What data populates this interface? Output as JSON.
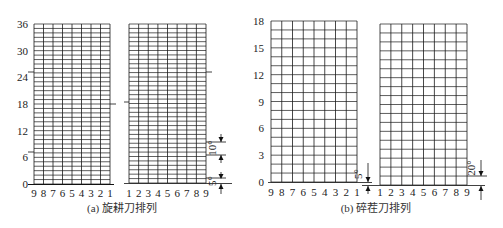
{
  "panels": [
    {
      "id": "a",
      "caption": "(a) 旋耕刀排列",
      "y_ticks": [
        "0",
        "6",
        "12",
        "18",
        "24",
        "30",
        "36"
      ],
      "y_max": 36,
      "rows": 36,
      "left_x_labels": [
        "9",
        "8",
        "7",
        "6",
        "5",
        "4",
        "3",
        "2",
        "1"
      ],
      "right_x_labels": [
        "1",
        "2",
        "3",
        "4",
        "5",
        "6",
        "7",
        "8",
        "9"
      ],
      "dimensions": [
        {
          "label": "10°",
          "position": "right-mid"
        },
        {
          "label": "5°",
          "position": "right-bottom"
        }
      ]
    },
    {
      "id": "b",
      "caption": "(b) 碎茬刀排列",
      "y_ticks": [
        "0",
        "3",
        "6",
        "9",
        "12",
        "15",
        "18"
      ],
      "y_max": 18,
      "rows": 18,
      "left_x_labels": [
        "9",
        "8",
        "7",
        "6",
        "5",
        "4",
        "3",
        "2",
        "1"
      ],
      "right_x_labels": [
        "1",
        "2",
        "3",
        "4",
        "5",
        "6",
        "7",
        "8",
        "9"
      ],
      "dimensions": [
        {
          "label": "5°",
          "position": "center-gap"
        },
        {
          "label": "20°",
          "position": "right-bottom"
        }
      ]
    }
  ],
  "colors": {
    "grid": "#1a1a1a",
    "text": "#222222",
    "background": "#ffffff"
  }
}
